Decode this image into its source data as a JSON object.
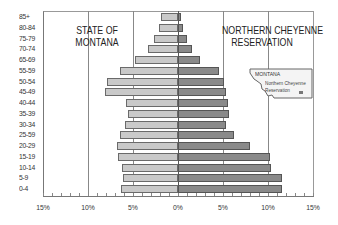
{
  "chart_data": {
    "type": "bar",
    "subtype": "population-pyramid",
    "categories": [
      "85+",
      "80-84",
      "75-79",
      "70-74",
      "65-69",
      "55-59",
      "50-54",
      "45-49",
      "40-44",
      "35-39",
      "30-34",
      "25-59",
      "20-29",
      "15-19",
      "10-14",
      "5-9",
      "0-4"
    ],
    "series": [
      {
        "name": "State of Montana",
        "side": "left",
        "color": "#c9c9c9",
        "values": [
          1.9,
          2.1,
          2.7,
          3.3,
          4.8,
          6.4,
          7.9,
          8.1,
          5.8,
          5.6,
          5.9,
          6.4,
          6.8,
          6.7,
          6.2,
          6.1,
          6.3
        ]
      },
      {
        "name": "Northern Cheyenne Reservation",
        "side": "right",
        "color": "#8a8a8a",
        "values": [
          0.3,
          0.5,
          1.0,
          1.6,
          2.4,
          4.6,
          5.1,
          5.3,
          5.6,
          5.7,
          5.3,
          6.2,
          8.0,
          10.2,
          10.3,
          11.6,
          11.6
        ]
      }
    ],
    "title": "",
    "xlabel": "",
    "ylabel": "",
    "xticks": [
      "15%",
      "10%",
      "5%",
      "0%",
      "5%",
      "10%",
      "15%"
    ],
    "xlim": [
      -15,
      15
    ],
    "grid": "vertical at 5% and 10% each side",
    "annotations": {
      "left_title": [
        "STATE OF",
        "MONTANA"
      ],
      "right_title": [
        "NORTHERN CHEYENNE",
        "RESERVATION"
      ],
      "inset_map": {
        "state_label": "MONTANA",
        "reservation_label": [
          "Northern Cheyenne",
          "Reservation"
        ]
      }
    }
  }
}
